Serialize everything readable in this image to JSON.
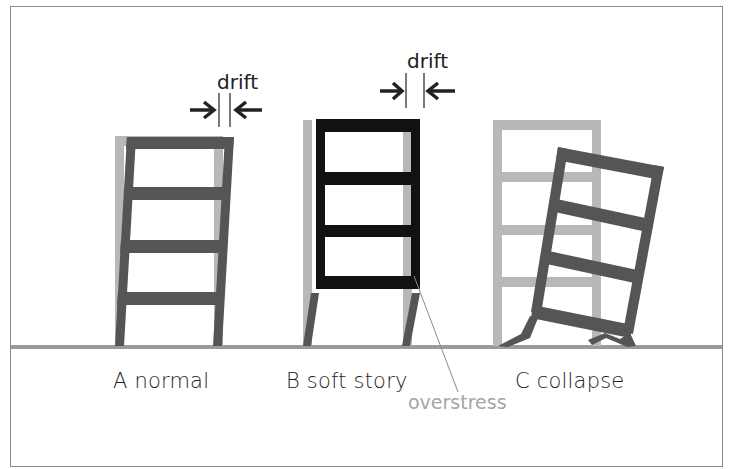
{
  "diagram": {
    "panels": [
      {
        "id": "A",
        "label": "A normal",
        "annotation": "drift"
      },
      {
        "id": "B",
        "label": "B soft story",
        "annotation": "drift",
        "callout": "overstress"
      },
      {
        "id": "C",
        "label": "C collapse"
      }
    ],
    "colors": {
      "original_frame": "#b3b3b3",
      "deformed_frame": "#555555",
      "stiff_upper_frame": "#111111",
      "ground": "#9a9a9a",
      "callout_text": "#a5a5a5",
      "border": "#8a8a8a"
    }
  }
}
